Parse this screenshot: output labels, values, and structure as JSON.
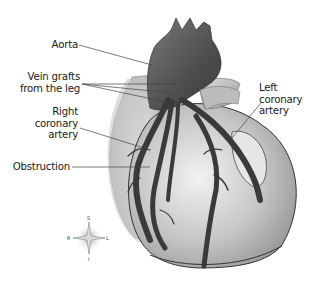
{
  "figure": {
    "labels": {
      "aorta": "Aorta",
      "vein_grafts_line1": "Vein grafts",
      "vein_grafts_line2": "from the leg",
      "right_coronary_line1": "Right",
      "right_coronary_line2": "coronary",
      "right_coronary_line3": "artery",
      "obstruction": "Obstruction",
      "left_coronary_line1": "Left",
      "left_coronary_line2": "coronary",
      "left_coronary_line3": "artery"
    },
    "compass": {
      "superior": "S",
      "inferior": "I",
      "right": "R",
      "left": "L"
    },
    "colors": {
      "vessel": "#3a3a3a",
      "aorta": "#5a5a5a",
      "heart_light": "#d8d8d8",
      "heart_mid": "#b0b0b0",
      "background_tissue": "#c4c4c4",
      "label_line": "#444444"
    }
  }
}
